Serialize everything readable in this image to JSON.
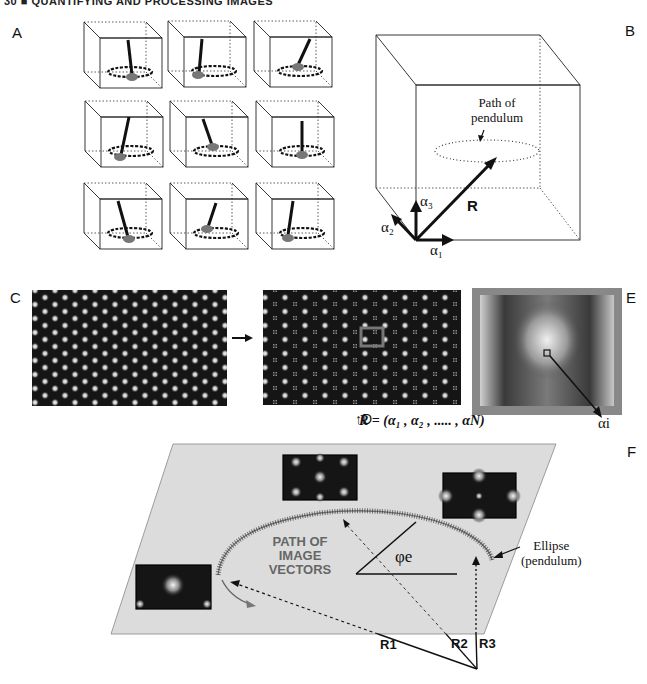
{
  "header": {
    "running_title": "30 ■ QUANTIFYING AND PROCESSING IMAGES"
  },
  "panels": {
    "A": {
      "label": "A",
      "description": "3x3 grid of boxes each showing pendulum on circular dashed path"
    },
    "B": {
      "label": "B",
      "annotation_line1": "Path of",
      "annotation_line2": "pendulum",
      "vector_label": "R",
      "axis_1": "α₁",
      "axis_2": "α₂",
      "axis_3": "α₃"
    },
    "C": {
      "label": "C"
    },
    "D": {
      "label": "↑D"
    },
    "E": {
      "label": "E",
      "equation": "R = (α₁ , α₂ , ..... , αN)",
      "pixel_label": "αi"
    },
    "F": {
      "label": "F",
      "path_text_1": "PATH OF",
      "path_text_2": "IMAGE",
      "path_text_3": "VECTORS",
      "angle_label": "φe",
      "ellipse_label_1": "Ellipse",
      "ellipse_label_2": "(pendulum)",
      "vectors": [
        "R1",
        "R2",
        "R3"
      ]
    }
  },
  "colors": {
    "plane": "#dcdcdc",
    "ink": "#111111",
    "grey_bob": "#777777",
    "dark_image": "#151515"
  }
}
